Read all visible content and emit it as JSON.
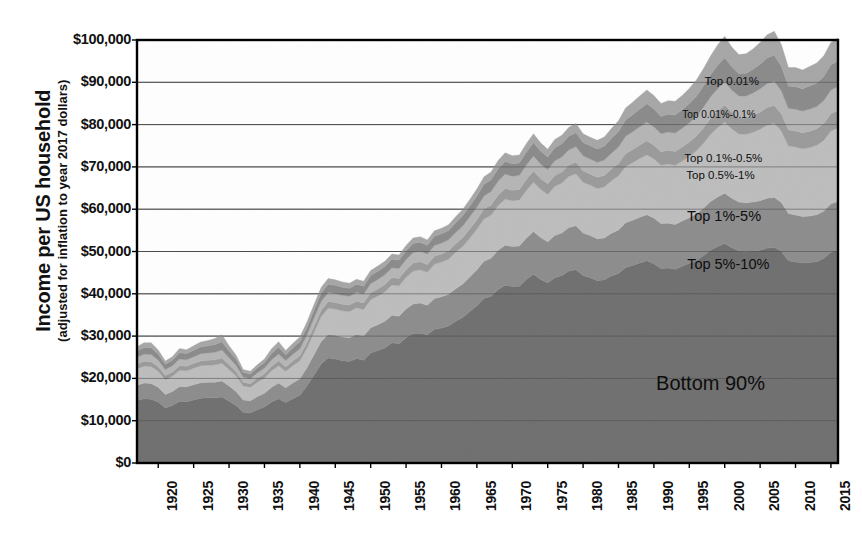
{
  "chart_data": {
    "type": "area",
    "stacked": true,
    "title": "",
    "xlabel": "",
    "ylabel": "Income per US household",
    "ylabel_sub": "(adjusted for inflation to year 2017 dollars)",
    "xlim": [
      1917,
      2016
    ],
    "ylim": [
      0,
      100000
    ],
    "grid": true,
    "legend_position": "inline-annotations",
    "y_ticks": [
      {
        "value": 0,
        "label": "$0"
      },
      {
        "value": 10000,
        "label": "$10,000"
      },
      {
        "value": 20000,
        "label": "$20,000"
      },
      {
        "value": 30000,
        "label": "$30,000"
      },
      {
        "value": 40000,
        "label": "$40,000"
      },
      {
        "value": 50000,
        "label": "$50,000"
      },
      {
        "value": 60000,
        "label": "$60,000"
      },
      {
        "value": 70000,
        "label": "$70,000"
      },
      {
        "value": 80000,
        "label": "$80,000"
      },
      {
        "value": 90000,
        "label": "$90,000"
      },
      {
        "value": 100000,
        "label": "$100,000"
      }
    ],
    "x_ticks": [
      {
        "value": 1920,
        "label": "1920"
      },
      {
        "value": 1925,
        "label": "1925"
      },
      {
        "value": 1930,
        "label": "1930"
      },
      {
        "value": 1935,
        "label": "1935"
      },
      {
        "value": 1940,
        "label": "1940"
      },
      {
        "value": 1945,
        "label": "1945"
      },
      {
        "value": 1950,
        "label": "1950"
      },
      {
        "value": 1955,
        "label": "1955"
      },
      {
        "value": 1960,
        "label": "1960"
      },
      {
        "value": 1965,
        "label": "1965"
      },
      {
        "value": 1970,
        "label": "1970"
      },
      {
        "value": 1975,
        "label": "1975"
      },
      {
        "value": 1980,
        "label": "1980"
      },
      {
        "value": 1985,
        "label": "1985"
      },
      {
        "value": 1990,
        "label": "1990"
      },
      {
        "value": 1995,
        "label": "1995"
      },
      {
        "value": 2000,
        "label": "2000"
      },
      {
        "value": 2005,
        "label": "2005"
      },
      {
        "value": 2010,
        "label": "2010"
      },
      {
        "value": 2015,
        "label": "2015"
      }
    ],
    "x": [
      1917,
      1918,
      1919,
      1920,
      1921,
      1922,
      1923,
      1924,
      1925,
      1926,
      1927,
      1928,
      1929,
      1930,
      1931,
      1932,
      1933,
      1934,
      1935,
      1936,
      1937,
      1938,
      1939,
      1940,
      1941,
      1942,
      1943,
      1944,
      1945,
      1946,
      1947,
      1948,
      1949,
      1950,
      1951,
      1952,
      1953,
      1954,
      1955,
      1956,
      1957,
      1958,
      1959,
      1960,
      1961,
      1962,
      1963,
      1964,
      1965,
      1966,
      1967,
      1968,
      1969,
      1970,
      1971,
      1972,
      1973,
      1974,
      1975,
      1976,
      1977,
      1978,
      1979,
      1980,
      1981,
      1982,
      1983,
      1984,
      1985,
      1986,
      1987,
      1988,
      1989,
      1990,
      1991,
      1992,
      1993,
      1994,
      1995,
      1996,
      1997,
      1998,
      1999,
      2000,
      2001,
      2002,
      2003,
      2004,
      2005,
      2006,
      2007,
      2008,
      2009,
      2010,
      2011,
      2012,
      2013,
      2014,
      2015,
      2016
    ],
    "series": [
      {
        "name": "Bottom 90%",
        "color": "#6f6f6f",
        "values": [
          14800,
          15200,
          15100,
          14400,
          13000,
          13600,
          14600,
          14500,
          14900,
          15300,
          15400,
          15400,
          15600,
          14600,
          13600,
          12000,
          11800,
          12600,
          13300,
          14400,
          15200,
          14300,
          15200,
          16000,
          18200,
          20800,
          23400,
          24800,
          24600,
          24200,
          24000,
          24700,
          24300,
          26000,
          26600,
          27200,
          28400,
          28200,
          29600,
          30600,
          30700,
          30300,
          31600,
          31900,
          32400,
          33500,
          34400,
          35800,
          37200,
          38900,
          39400,
          41000,
          42000,
          41700,
          41800,
          43400,
          44600,
          43400,
          42600,
          43800,
          44300,
          45400,
          45700,
          44300,
          43800,
          43100,
          43300,
          44200,
          44800,
          46200,
          46700,
          47300,
          47800,
          47100,
          46000,
          46100,
          45800,
          46500,
          47200,
          47900,
          49000,
          50300,
          51200,
          51900,
          50900,
          50100,
          49900,
          50100,
          50300,
          50800,
          51000,
          50000,
          47800,
          47500,
          47300,
          47400,
          47600,
          48400,
          49800,
          50200
        ]
      },
      {
        "name": "Top 5%-10%",
        "color": "#8c8c8c",
        "values": [
          3600,
          3700,
          3700,
          3500,
          3200,
          3300,
          3500,
          3500,
          3600,
          3700,
          3700,
          3700,
          3800,
          3600,
          3300,
          2900,
          2900,
          3100,
          3200,
          3500,
          3700,
          3500,
          3700,
          3900,
          4300,
          4800,
          5300,
          5600,
          5600,
          5600,
          5600,
          5700,
          5700,
          6000,
          6100,
          6300,
          6500,
          6500,
          6800,
          7000,
          7100,
          7000,
          7300,
          7400,
          7500,
          7700,
          7900,
          8200,
          8500,
          8800,
          9000,
          9300,
          9500,
          9500,
          9500,
          9800,
          10100,
          9900,
          9700,
          10000,
          10100,
          10300,
          10400,
          10100,
          10000,
          9900,
          9900,
          10100,
          10300,
          10600,
          10700,
          10800,
          10900,
          10800,
          10600,
          10600,
          10600,
          10700,
          10800,
          11000,
          11200,
          11500,
          11700,
          11900,
          11700,
          11600,
          11600,
          11600,
          11700,
          11800,
          11800,
          11600,
          11200,
          11100,
          11000,
          11000,
          11100,
          11200,
          11500,
          11600
        ]
      },
      {
        "name": "Top 1%-5%",
        "color": "#bdbdbd",
        "values": [
          3900,
          4000,
          4000,
          3800,
          3500,
          3600,
          3800,
          3800,
          3900,
          4000,
          4000,
          4100,
          4200,
          3900,
          3700,
          3300,
          3200,
          3400,
          3600,
          3900,
          4100,
          3900,
          4100,
          4300,
          4700,
          5300,
          5900,
          6200,
          6200,
          6200,
          6200,
          6300,
          6300,
          6600,
          6800,
          7000,
          7200,
          7200,
          7500,
          7800,
          7900,
          7800,
          8100,
          8200,
          8300,
          8600,
          8900,
          9200,
          9600,
          10000,
          10200,
          10600,
          10900,
          10800,
          10900,
          11300,
          11700,
          11400,
          11200,
          11600,
          11800,
          12100,
          12300,
          12000,
          11900,
          11900,
          12100,
          12400,
          12800,
          13300,
          13600,
          13900,
          14200,
          14000,
          13800,
          14000,
          14000,
          14200,
          14500,
          14900,
          15400,
          15900,
          16400,
          16800,
          16400,
          16100,
          16200,
          16500,
          16900,
          17300,
          17500,
          16900,
          16000,
          16100,
          16000,
          16200,
          16400,
          16700,
          17200,
          17400
        ]
      },
      {
        "name": "Top 0.5%-1%",
        "color": "#9a9a9a",
        "values": [
          1100,
          1150,
          1150,
          1080,
          980,
          1020,
          1100,
          1080,
          1120,
          1150,
          1170,
          1200,
          1250,
          1120,
          1030,
          880,
          860,
          920,
          970,
          1080,
          1150,
          1050,
          1120,
          1180,
          1300,
          1420,
          1520,
          1570,
          1560,
          1550,
          1540,
          1560,
          1550,
          1620,
          1660,
          1700,
          1740,
          1740,
          1800,
          1860,
          1870,
          1840,
          1900,
          1920,
          1950,
          2010,
          2070,
          2150,
          2230,
          2320,
          2370,
          2450,
          2520,
          2480,
          2480,
          2560,
          2640,
          2560,
          2500,
          2580,
          2620,
          2680,
          2730,
          2650,
          2620,
          2630,
          2690,
          2790,
          2900,
          3030,
          3110,
          3190,
          3270,
          3220,
          3160,
          3210,
          3230,
          3290,
          3380,
          3480,
          3620,
          3760,
          3900,
          4020,
          3900,
          3820,
          3850,
          3940,
          4050,
          4170,
          4220,
          4040,
          3760,
          3790,
          3780,
          3850,
          3900,
          3980,
          4110,
          4160
        ]
      },
      {
        "name": "Top 0.1%-0.5%",
        "color": "#b5b5b5",
        "values": [
          1600,
          1680,
          1680,
          1560,
          1400,
          1460,
          1580,
          1550,
          1620,
          1680,
          1720,
          1780,
          1860,
          1640,
          1480,
          1240,
          1200,
          1290,
          1360,
          1520,
          1620,
          1460,
          1560,
          1650,
          1800,
          1960,
          2080,
          2140,
          2120,
          2100,
          2080,
          2100,
          2090,
          2180,
          2230,
          2280,
          2330,
          2330,
          2410,
          2490,
          2500,
          2460,
          2540,
          2570,
          2610,
          2690,
          2780,
          2890,
          3000,
          3120,
          3190,
          3300,
          3390,
          3330,
          3330,
          3440,
          3550,
          3440,
          3360,
          3470,
          3520,
          3600,
          3670,
          3560,
          3520,
          3540,
          3620,
          3760,
          3910,
          4090,
          4200,
          4310,
          4420,
          4350,
          4270,
          4340,
          4370,
          4460,
          4580,
          4720,
          4910,
          5100,
          5300,
          5460,
          5280,
          5160,
          5210,
          5340,
          5500,
          5660,
          5740,
          5480,
          5090,
          5140,
          5120,
          5220,
          5290,
          5400,
          5580,
          5650
        ]
      },
      {
        "name": "Top 0.01%-0.1%",
        "color": "#8a8a8a",
        "values": [
          1500,
          1600,
          1620,
          1450,
          1250,
          1320,
          1480,
          1430,
          1520,
          1620,
          1700,
          1820,
          1980,
          1640,
          1400,
          1100,
          1060,
          1180,
          1280,
          1500,
          1640,
          1400,
          1520,
          1620,
          1760,
          1880,
          1940,
          1960,
          1930,
          1900,
          1870,
          1870,
          1850,
          1920,
          1950,
          1980,
          2010,
          2000,
          2070,
          2140,
          2140,
          2090,
          2170,
          2190,
          2230,
          2310,
          2400,
          2510,
          2620,
          2750,
          2820,
          2930,
          3030,
          2950,
          2930,
          3050,
          3170,
          3040,
          2960,
          3080,
          3130,
          3220,
          3300,
          3180,
          3140,
          3180,
          3280,
          3450,
          3640,
          3880,
          4020,
          4160,
          4310,
          4220,
          4110,
          4210,
          4260,
          4370,
          4530,
          4730,
          4990,
          5240,
          5520,
          5750,
          5480,
          5310,
          5390,
          5580,
          5810,
          6050,
          6160,
          5800,
          5250,
          5330,
          5280,
          5440,
          5520,
          5670,
          5930,
          6040
        ]
      },
      {
        "name": "Top 0.01%",
        "color": "#a6a6a6",
        "values": [
          1000,
          1120,
          1150,
          950,
          760,
          830,
          990,
          930,
          1040,
          1160,
          1260,
          1420,
          1640,
          1230,
          970,
          680,
          650,
          760,
          860,
          1080,
          1230,
          960,
          1080,
          1160,
          1260,
          1320,
          1340,
          1330,
          1290,
          1250,
          1210,
          1190,
          1160,
          1200,
          1210,
          1210,
          1220,
          1200,
          1250,
          1300,
          1290,
          1240,
          1300,
          1310,
          1340,
          1400,
          1470,
          1560,
          1650,
          1760,
          1820,
          1910,
          1990,
          1900,
          1870,
          1970,
          2080,
          1940,
          1860,
          1970,
          2010,
          2090,
          2170,
          2040,
          2000,
          2060,
          2170,
          2360,
          2570,
          2830,
          2980,
          3130,
          3300,
          3190,
          3060,
          3180,
          3240,
          3370,
          3560,
          3790,
          4110,
          4420,
          4790,
          5080,
          4690,
          4460,
          4570,
          4830,
          5150,
          5470,
          5620,
          5130,
          4400,
          4510,
          4430,
          4650,
          4740,
          4930,
          5280,
          5420
        ]
      }
    ],
    "band_labels": [
      {
        "text": "Top 0.01%",
        "x": 2001.0,
        "y": 89500,
        "size": "sm"
      },
      {
        "text": "Top 0.01%-0.1%",
        "x": 1999.2,
        "y": 81500,
        "size": "xs"
      },
      {
        "text": "Top 0.1%-0.5%",
        "x": 1999.8,
        "y": 71500,
        "size": "sm"
      },
      {
        "text": "Top 0.5%-1%",
        "x": 1999.4,
        "y": 67300,
        "size": "sm"
      },
      {
        "text": "Top 1%-5%",
        "x": 1999.9,
        "y": 58200,
        "size": "md"
      },
      {
        "text": "Top 5%-10%",
        "x": 2000.5,
        "y": 46800,
        "size": "md"
      },
      {
        "text": "Bottom 90%",
        "x": 1998.0,
        "y": 19500,
        "size": "lg"
      }
    ],
    "colors": {
      "background": "#ffffff",
      "axis": "#000000",
      "grid": "#4a4a4a",
      "text": "#111111"
    }
  }
}
